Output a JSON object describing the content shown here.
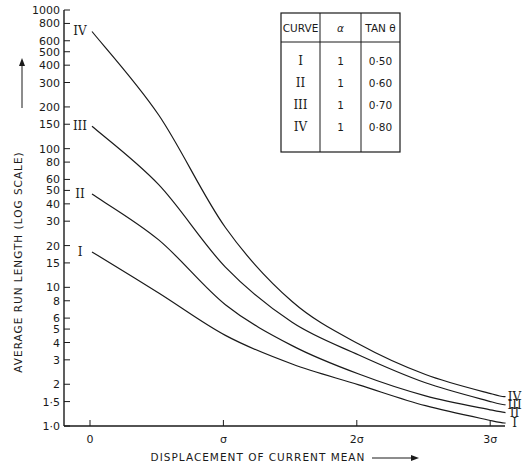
{
  "chart_data": {
    "type": "line",
    "title": "",
    "xlabel": "DISPLACEMENT OF CURRENT MEAN",
    "ylabel": "AVERAGE RUN LENGTH (LOG SCALE)",
    "y_scale": "log",
    "ylim": [
      1.0,
      1000
    ],
    "xlim": [
      0,
      3
    ],
    "grid": false,
    "x_ticks": [
      {
        "value": 0,
        "label": "0"
      },
      {
        "value": 1,
        "label": "σ"
      },
      {
        "value": 2,
        "label": "2σ"
      },
      {
        "value": 3,
        "label": "3σ"
      }
    ],
    "y_ticks": [
      {
        "value": 1.0,
        "label": "1·0"
      },
      {
        "value": 1.5,
        "label": "1·5"
      },
      {
        "value": 2,
        "label": "2"
      },
      {
        "value": 3,
        "label": "3"
      },
      {
        "value": 4,
        "label": "4"
      },
      {
        "value": 5,
        "label": "5"
      },
      {
        "value": 6,
        "label": "6"
      },
      {
        "value": 8,
        "label": "8"
      },
      {
        "value": 10,
        "label": "10"
      },
      {
        "value": 15,
        "label": "15"
      },
      {
        "value": 20,
        "label": "20"
      },
      {
        "value": 30,
        "label": "30"
      },
      {
        "value": 40,
        "label": "40"
      },
      {
        "value": 50,
        "label": "50"
      },
      {
        "value": 60,
        "label": "60"
      },
      {
        "value": 80,
        "label": "80"
      },
      {
        "value": 100,
        "label": "100"
      },
      {
        "value": 150,
        "label": "150"
      },
      {
        "value": 200,
        "label": "200"
      },
      {
        "value": 300,
        "label": "300"
      },
      {
        "value": 400,
        "label": "400"
      },
      {
        "value": 500,
        "label": "500"
      },
      {
        "value": 600,
        "label": "600"
      },
      {
        "value": 800,
        "label": "800"
      },
      {
        "value": 1000,
        "label": "1000"
      }
    ],
    "x": [
      0,
      0.5,
      1,
      1.5,
      2,
      2.5,
      3,
      3.1
    ],
    "series": [
      {
        "name": "I",
        "label": "I",
        "values": [
          18,
          9.1,
          4.5,
          2.8,
          1.98,
          1.4,
          1.09,
          1.05
        ]
      },
      {
        "name": "II",
        "label": "II",
        "values": [
          47,
          22,
          7.5,
          3.8,
          2.37,
          1.65,
          1.3,
          1.25
        ]
      },
      {
        "name": "III",
        "label": "III",
        "values": [
          145,
          55,
          14,
          5.6,
          3.25,
          2.05,
          1.49,
          1.42
        ]
      },
      {
        "name": "IV",
        "label": "IV",
        "values": [
          700,
          175,
          27,
          7.9,
          3.9,
          2.35,
          1.7,
          1.63
        ]
      }
    ],
    "legend_table": {
      "headers": [
        "CURVE",
        "α",
        "TAN θ"
      ],
      "rows": [
        [
          "I",
          "1",
          "0·50"
        ],
        [
          "II",
          "1",
          "0·60"
        ],
        [
          "III",
          "1",
          "0·70"
        ],
        [
          "IV",
          "1",
          "0·80"
        ]
      ],
      "position": "top-right"
    }
  },
  "chart": {
    "colors": {
      "ink": "#1a1a1a",
      "background": "#ffffff"
    },
    "x_arrow": "long-arrow-right",
    "y_arrow": "long-arrow-up"
  }
}
